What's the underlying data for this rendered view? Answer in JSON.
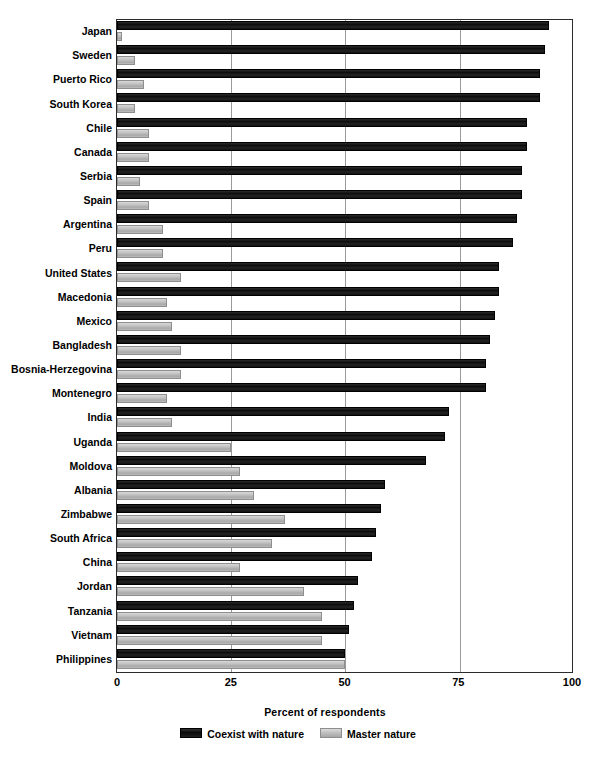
{
  "chart_data": {
    "type": "bar",
    "orientation": "horizontal",
    "title": "",
    "xlabel": "Percent of respondents",
    "ylabel": "",
    "xlim": [
      0,
      100
    ],
    "xticks": [
      0,
      25,
      50,
      75,
      100
    ],
    "grid": true,
    "legend_position": "bottom",
    "categories": [
      "Japan",
      "Sweden",
      "Puerto Rico",
      "South Korea",
      "Chile",
      "Canada",
      "Serbia",
      "Spain",
      "Argentina",
      "Peru",
      "United States",
      "Macedonia",
      "Mexico",
      "Bangladesh",
      "Bosnia-Herzegovina",
      "Montenegro",
      "India",
      "Uganda",
      "Moldova",
      "Albania",
      "Zimbabwe",
      "South Africa",
      "China",
      "Jordan",
      "Tanzania",
      "Vietnam",
      "Philippines"
    ],
    "series": [
      {
        "name": "Coexist with nature",
        "color": "#151515",
        "values": [
          95,
          94,
          93,
          93,
          90,
          90,
          89,
          89,
          88,
          87,
          84,
          84,
          83,
          82,
          81,
          81,
          73,
          72,
          68,
          59,
          58,
          57,
          56,
          53,
          52,
          51,
          50
        ]
      },
      {
        "name": "Master nature",
        "color": "#bcbcbc",
        "values": [
          1,
          4,
          6,
          4,
          7,
          7,
          5,
          7,
          10,
          10,
          14,
          11,
          12,
          14,
          14,
          11,
          12,
          25,
          27,
          30,
          37,
          34,
          27,
          41,
          45,
          45,
          50
        ]
      }
    ]
  },
  "axis": {
    "tick_labels": [
      "0",
      "25",
      "50",
      "75",
      "100"
    ],
    "title": "Percent of respondents"
  },
  "legend": {
    "items": [
      {
        "label": "Coexist with nature",
        "swatch": "dark-swatch-icon"
      },
      {
        "label": "Master nature",
        "swatch": "light-swatch-icon"
      }
    ]
  }
}
